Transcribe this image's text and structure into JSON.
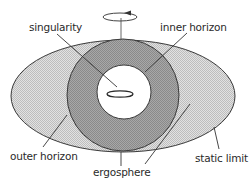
{
  "diagram": {
    "labels": {
      "singularity": "singularity",
      "inner_horizon": "inner horizon",
      "outer_horizon": "outer horizon",
      "ergosphere": "ergosphere",
      "static_limit": "static limit"
    },
    "regions": [
      {
        "name": "static limit",
        "shape": "ellipse",
        "fill": "#d4d4d4"
      },
      {
        "name": "outer horizon",
        "shape": "circle",
        "fill": "#9a9a9a"
      },
      {
        "name": "inner horizon",
        "shape": "circle",
        "fill": "#ffffff"
      },
      {
        "name": "singularity",
        "shape": "ring",
        "fill": "#ffffff"
      }
    ],
    "rotation_indicator": "counter-clockwise arrow around vertical axis",
    "colors": {
      "outline": "#3a3a3a",
      "ergosphere_fill": "#d4d4d4",
      "horizon_fill": "#9a9a9a",
      "inner_fill": "#ffffff"
    }
  }
}
